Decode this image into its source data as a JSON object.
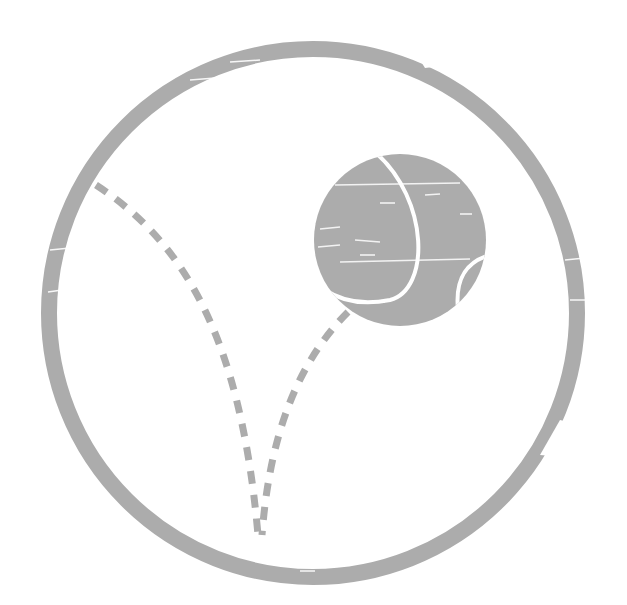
{
  "image": {
    "description": "Grunge-style gray circular icon with a tennis ball and dashed bounce trajectory",
    "alt_text": "Tennis ball bounce icon"
  },
  "colors": {
    "icon_gray": "#acacac",
    "background": "#ffffff",
    "seam": "#ffffff"
  },
  "icons": {
    "ring": "outer-ring-icon",
    "ball": "tennis-ball-icon",
    "trajectory": "bounce-trajectory-icon"
  }
}
